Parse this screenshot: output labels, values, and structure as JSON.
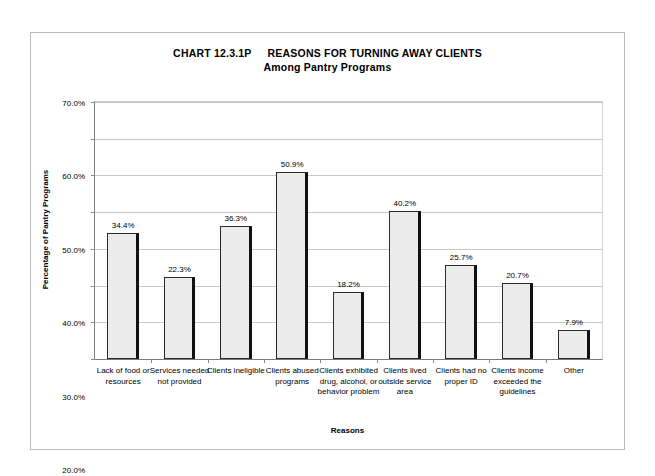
{
  "chart_data": {
    "type": "bar",
    "title_number": "CHART 12.3.1P",
    "title_main": "REASONS FOR TURNING AWAY CLIENTS",
    "subtitle": "Among Pantry Programs",
    "xlabel": "Reasons",
    "ylabel": "Percentage of Pantry Programs",
    "ylim": [
      0,
      70
    ],
    "ytick_step": 10,
    "ytick_labels": [
      "0.0%",
      "10.0%",
      "20.0%",
      "30.0%",
      "40.0%",
      "50.0%",
      "60.0%",
      "70.0%"
    ],
    "ytick_values": [
      0,
      10,
      20,
      30,
      40,
      50,
      60,
      70
    ],
    "grid": true,
    "legend": false,
    "categories": [
      "Lack of food or resources",
      "Services needed not provided",
      "Clients ineligible",
      "Clients abused programs",
      "Clients exhibited drug, alcohol, or behavior problem",
      "Clients lived outside service area",
      "Clients had no proper ID",
      "Clients income exceeded the guidelines",
      "Other"
    ],
    "values": [
      34.4,
      22.3,
      36.3,
      50.9,
      18.2,
      40.2,
      25.7,
      20.7,
      7.9
    ],
    "data_labels": [
      "34.4%",
      "22.3%",
      "36.3%",
      "50.9%",
      "18.2%",
      "40.2%",
      "25.7%",
      "20.7%",
      "7.9%"
    ],
    "bar_fill_color": "#ececec",
    "bar_border_color": "#2b2b2b",
    "gridline_color": "#c8c8c8",
    "frame_color": "#b9b9b9"
  }
}
